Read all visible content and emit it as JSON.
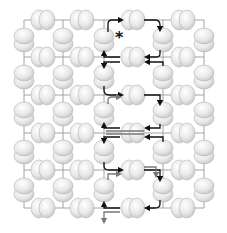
{
  "diagram": {
    "width": 227,
    "height": 233,
    "colors": {
      "sphere_fill": "#ececec",
      "sphere_shade": "#d2d2d2",
      "sphere_edge": "#b5b5b5",
      "wire": "#9a9a9a",
      "path_primary": "#111111",
      "path_secondary": "#777777"
    },
    "marker": {
      "symbol": "*",
      "x": 115,
      "y": 43,
      "label": "start-marker"
    },
    "horizontal_pair_columns": [
      43,
      82,
      133,
      183
    ],
    "horizontal_pair_rows": [
      20,
      57,
      95,
      133,
      170,
      208
    ],
    "vertical_stack_columns": [
      24,
      63,
      104,
      163,
      204
    ],
    "vertical_stack_rows": [
      40,
      77,
      114,
      152,
      190
    ],
    "paths": [
      {
        "color": "primary",
        "d": "M108 32 L108 24 Q108 20 112 20 L122 20",
        "arrow_end": [
          122,
          20
        ]
      },
      {
        "color": "primary",
        "d": "M144 20 L155 20 Q160 20 160 25 L160 30",
        "arrow_end": [
          160,
          30
        ]
      },
      {
        "color": "primary",
        "d": "M160 50 L160 54 Q160 57 156 57 L146 57",
        "arrow_end": [
          146,
          57
        ]
      },
      {
        "color": "primary",
        "d": "M120 57 L104 57 L104 52",
        "arrow_end": [
          104,
          52
        ]
      },
      {
        "color": "primary",
        "d": "M163 66 L163 62 L146 62",
        "arrow_end": [
          146,
          62
        ]
      },
      {
        "color": "primary",
        "d": "M120 62 L104 62 L104 67",
        "arrow_end": [
          104,
          67
        ]
      },
      {
        "color": "primary",
        "d": "M104 86 L104 90 Q104 95 109 95 L122 95",
        "arrow_end": [
          122,
          95
        ]
      },
      {
        "color": "primary",
        "d": "M144 95 L160 95 L160 104",
        "arrow_end": [
          160,
          104
        ]
      },
      {
        "color": "primary",
        "d": "M160 124 L160 128 L146 128",
        "arrow_end": [
          146,
          128
        ]
      },
      {
        "color": "primary",
        "d": "M120 128 L104 128 L104 124",
        "arrow_end": [
          104,
          124
        ]
      },
      {
        "color": "primary",
        "d": "M163 142 L163 137 L146 137",
        "arrow_end": [
          146,
          137
        ]
      },
      {
        "color": "primary",
        "d": "M120 137 L104 137 L104 142",
        "arrow_end": [
          104,
          142
        ]
      },
      {
        "color": "primary",
        "d": "M104 162 L104 166 Q104 170 109 170 L122 170",
        "arrow_end": [
          122,
          170
        ]
      },
      {
        "color": "primary",
        "d": "M144 170 L160 170 L160 180",
        "arrow_end": [
          160,
          180
        ]
      },
      {
        "color": "primary",
        "d": "M160 200 L160 204 Q160 208 155 208 L146 208",
        "arrow_end": [
          146,
          208
        ]
      },
      {
        "color": "primary",
        "d": "M120 208 L104 208 L104 203",
        "arrow_end": [
          104,
          203
        ]
      },
      {
        "color": "secondary",
        "d": "M120 212 L104 212 L104 222",
        "arrow_end": [
          104,
          222
        ]
      },
      {
        "color": "secondary",
        "d": "M108 104 L108 100 Q108 97 112 97 L120 97",
        "arrow_end": [
          120,
          97
        ]
      },
      {
        "color": "secondary",
        "d": "M144 131 L106 131",
        "arrow_end": null
      },
      {
        "color": "secondary",
        "d": "M144 134 L106 134",
        "arrow_end": null
      },
      {
        "color": "secondary",
        "d": "M144 167 L156 167 L156 176",
        "arrow_end": [
          156,
          176
        ]
      },
      {
        "color": "secondary",
        "d": "M108 180 L108 174 L120 174",
        "arrow_end": [
          120,
          174
        ]
      }
    ]
  }
}
